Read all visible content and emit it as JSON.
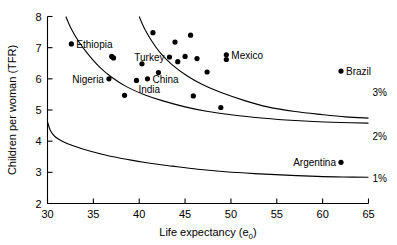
{
  "chart_data": {
    "type": "scatter",
    "title": "",
    "xlabel": "Life expectancy (e0)",
    "xlabel_main": "Life expectancy (e",
    "xlabel_sub": "0",
    "xlabel_close": ")",
    "ylabel": "Children per woman (TFR)",
    "xlim": [
      30,
      65
    ],
    "ylim": [
      2,
      8
    ],
    "xticks": [
      30,
      35,
      40,
      45,
      50,
      55,
      60,
      65
    ],
    "yticks": [
      2,
      3,
      4,
      5,
      6,
      7,
      8
    ],
    "grid": false,
    "legend_position": "none",
    "annotations": [
      {
        "text": "3%",
        "x": 65.8,
        "y": 5.57
      },
      {
        "text": "2%",
        "x": 65.8,
        "y": 4.18
      },
      {
        "text": "1%",
        "x": 65.8,
        "y": 2.82
      }
    ],
    "curves": [
      {
        "name": "3% growth isoline",
        "label": "3%",
        "points": [
          [
            32.0,
            8.0
          ],
          [
            32.6,
            7.6
          ],
          [
            33.4,
            7.2
          ],
          [
            34.4,
            6.8
          ],
          [
            35.6,
            6.4
          ],
          [
            37.0,
            6.05
          ],
          [
            38.6,
            5.75
          ],
          [
            40.5,
            5.5
          ],
          [
            42.5,
            5.3
          ],
          [
            45.0,
            5.1
          ],
          [
            47.5,
            4.95
          ],
          [
            50.0,
            4.85
          ],
          [
            53.0,
            4.75
          ],
          [
            56.0,
            4.68
          ],
          [
            59.0,
            4.63
          ],
          [
            62.0,
            4.6
          ],
          [
            65.0,
            4.58
          ]
        ]
      },
      {
        "name": "2% growth isoline",
        "label": "2%",
        "points": [
          [
            40.0,
            8.0
          ],
          [
            40.6,
            7.6
          ],
          [
            41.4,
            7.2
          ],
          [
            42.4,
            6.8
          ],
          [
            43.6,
            6.45
          ],
          [
            45.2,
            6.1
          ],
          [
            47.0,
            5.8
          ],
          [
            49.0,
            5.55
          ],
          [
            51.5,
            5.3
          ],
          [
            54.0,
            5.1
          ],
          [
            57.0,
            4.95
          ],
          [
            60.0,
            4.85
          ],
          [
            62.5,
            4.78
          ],
          [
            65.0,
            4.74
          ]
        ]
      },
      {
        "name": "1% growth isoline",
        "label": "1%",
        "points": [
          [
            30.0,
            4.62
          ],
          [
            30.3,
            4.35
          ],
          [
            30.8,
            4.15
          ],
          [
            31.6,
            4.0
          ],
          [
            32.8,
            3.85
          ],
          [
            34.4,
            3.7
          ],
          [
            36.4,
            3.55
          ],
          [
            38.6,
            3.42
          ],
          [
            41.0,
            3.3
          ],
          [
            43.6,
            3.2
          ],
          [
            46.4,
            3.1
          ],
          [
            49.4,
            3.02
          ],
          [
            52.6,
            2.96
          ],
          [
            56.0,
            2.91
          ],
          [
            59.4,
            2.87
          ],
          [
            62.2,
            2.85
          ],
          [
            65.0,
            2.84
          ]
        ]
      }
    ],
    "points": [
      {
        "label": "Ethiopia",
        "x": 32.6,
        "y": 7.12,
        "label_pos": "right"
      },
      {
        "label": "",
        "x": 37.0,
        "y": 6.72,
        "label_pos": "none"
      },
      {
        "label": "",
        "x": 37.2,
        "y": 6.67,
        "label_pos": "none"
      },
      {
        "label": "Nigeria",
        "x": 36.7,
        "y": 6.0,
        "label_pos": "left"
      },
      {
        "label": "",
        "x": 38.4,
        "y": 5.47,
        "label_pos": "none"
      },
      {
        "label": "India",
        "x": 39.7,
        "y": 5.95,
        "label_pos": "below"
      },
      {
        "label": "China",
        "x": 40.9,
        "y": 6.0,
        "label_pos": "right"
      },
      {
        "label": "",
        "x": 40.3,
        "y": 6.48,
        "label_pos": "none"
      },
      {
        "label": "",
        "x": 41.5,
        "y": 7.48,
        "label_pos": "none"
      },
      {
        "label": "",
        "x": 42.1,
        "y": 6.2,
        "label_pos": "none"
      },
      {
        "label": "Turkey",
        "x": 43.3,
        "y": 6.7,
        "label_pos": "left"
      },
      {
        "label": "",
        "x": 43.9,
        "y": 7.18,
        "label_pos": "none"
      },
      {
        "label": "",
        "x": 44.2,
        "y": 6.55,
        "label_pos": "none"
      },
      {
        "label": "",
        "x": 45.0,
        "y": 6.72,
        "label_pos": "none"
      },
      {
        "label": "",
        "x": 45.6,
        "y": 7.4,
        "label_pos": "none"
      },
      {
        "label": "",
        "x": 46.3,
        "y": 6.65,
        "label_pos": "none"
      },
      {
        "label": "",
        "x": 47.4,
        "y": 6.22,
        "label_pos": "none"
      },
      {
        "label": "",
        "x": 45.9,
        "y": 5.45,
        "label_pos": "none"
      },
      {
        "label": "Mexico",
        "x": 49.5,
        "y": 6.77,
        "label_pos": "right"
      },
      {
        "label": "Mexico2",
        "x": 49.5,
        "y": 6.62,
        "label_pos": "none"
      },
      {
        "label": "",
        "x": 48.9,
        "y": 5.08,
        "label_pos": "none"
      },
      {
        "label": "Brazil",
        "x": 62.0,
        "y": 6.25,
        "label_pos": "right"
      },
      {
        "label": "Argentina",
        "x": 62.0,
        "y": 3.32,
        "label_pos": "left"
      }
    ]
  }
}
